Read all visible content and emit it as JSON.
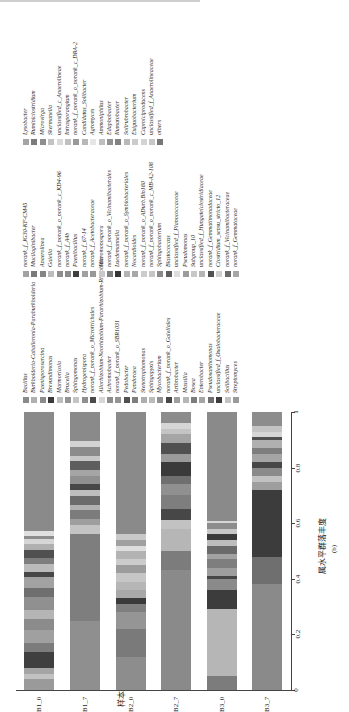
{
  "chart_data": {
    "type": "bar",
    "stacked": true,
    "orientation": "rotated (bars vertical, text rotated -90deg)",
    "xlabel": "属水平群落丰度",
    "ylabel": "样本",
    "panel_label": "(b)",
    "axis_ticks": [
      "0",
      "0.2",
      "0.4",
      "0.6",
      "0.8",
      "1"
    ],
    "xlim": [
      0,
      1
    ],
    "categories": [
      "B1_0",
      "B1_7",
      "B2_0",
      "B2_7",
      "B3_0",
      "B3_7"
    ],
    "legend": [
      {
        "name": "Bacillus",
        "color": "#8a8a8a"
      },
      {
        "name": "Burkholderia-Caballeronia-Paraburkholderia",
        "color": "#b0b0b0"
      },
      {
        "name": "Paenisporosarcina",
        "color": "#8c8c8c"
      },
      {
        "name": "Brevundimonas",
        "color": "#3a3a3a"
      },
      {
        "name": "Marmoricola",
        "color": "#bdbdbd"
      },
      {
        "name": "Brucella",
        "color": "#959595"
      },
      {
        "name": "Sphingomonas",
        "color": "#c4c4c4"
      },
      {
        "name": "Hydrogenispora",
        "color": "#8f8f8f"
      },
      {
        "name": "norank_f_norank_o_Microtrichales",
        "color": "#4a4a4a"
      },
      {
        "name": "Allorhizobium-Neorhizobium-Pararhizobium-Rhizobium",
        "color": "#d6d6d6"
      },
      {
        "name": "Achromobacter",
        "color": "#8d8d8d"
      },
      {
        "name": "norank_f_norank_o_SBR1031",
        "color": "#939393"
      },
      {
        "name": "Pedobacter",
        "color": "#505050"
      },
      {
        "name": "Pandoraea",
        "color": "#7e7e7e"
      },
      {
        "name": "Stenotrophomonas",
        "color": "#adadad"
      },
      {
        "name": "Sphingopyxis",
        "color": "#bbbbbb"
      },
      {
        "name": "Mycobacterium",
        "color": "#909090"
      },
      {
        "name": "norank_f_norank_o_Gaiellales",
        "color": "#474747"
      },
      {
        "name": "Arthrobacter",
        "color": "#9e9e9e"
      },
      {
        "name": "Massilia",
        "color": "#b6b6b6"
      },
      {
        "name": "Bosea",
        "color": "#7c7c7c"
      },
      {
        "name": "Enterobacter",
        "color": "#a5a5a5"
      },
      {
        "name": "Pseudoxanthomonas",
        "color": "#6f6f6f"
      },
      {
        "name": "unclassified_f_Oxalobacteraceae",
        "color": "#3c3c3c"
      },
      {
        "name": "Solibacillus",
        "color": "#c2c2c2"
      },
      {
        "name": "Streptomyces",
        "color": "#9a9a9a"
      },
      {
        "name": "norank_f_JG30-KF-CM45",
        "color": "#a2a2a2"
      },
      {
        "name": "Mucilaginibacter",
        "color": "#7a7a7a"
      },
      {
        "name": "Anaerolinea",
        "color": "#858585"
      },
      {
        "name": "Gaiella",
        "color": "#bcbcbc"
      },
      {
        "name": "norank_f_norank_o_norank_c_KD4-96",
        "color": "#8e8e8e"
      },
      {
        "name": "norank_f_A4b",
        "color": "#8b8b8b"
      },
      {
        "name": "Paenibacillus",
        "color": "#3f3f3f"
      },
      {
        "name": "norank_f_67-14",
        "color": "#a0a0a0"
      },
      {
        "name": "norank_f_Acetobacteraceae",
        "color": "#989898"
      },
      {
        "name": "Micromonospora",
        "color": "#c9c9c9"
      },
      {
        "name": "norank_f_norank_o_Vicinamibacterales",
        "color": "#7f7f7f"
      },
      {
        "name": "Luedemannella",
        "color": "#353535"
      },
      {
        "name": "norank_f_norank_o_Symbiobacteriales",
        "color": "#b3b3b3"
      },
      {
        "name": "Nocardioides",
        "color": "#a8a8a8"
      },
      {
        "name": "norank_f_norank_o_ADurb.Bin180",
        "color": "#cccccc"
      },
      {
        "name": "norank_f_norank_o_norank_c_MB-A2-108",
        "color": "#c6c6c6"
      },
      {
        "name": "Sphingobacterium",
        "color": "#8a8a8a"
      },
      {
        "name": "Blastococcus",
        "color": "#5e5e5e"
      },
      {
        "name": "unclassified_f_Planococcaceae",
        "color": "#dedede"
      },
      {
        "name": "Pseudomonas",
        "color": "#9c9c9c"
      },
      {
        "name": "Subgroup_10",
        "color": "#c7c7c7"
      },
      {
        "name": "unclassified_f_Hungateiclostridiaceae",
        "color": "#b5b5b5"
      },
      {
        "name": "norank_f_Gemmatimonadaceae",
        "color": "#515151"
      },
      {
        "name": "Clostridium_sensu_stricto_12",
        "color": "#cfcfcf"
      },
      {
        "name": "norank_f_Vicinamibacteraceae",
        "color": "#6a6a6a"
      },
      {
        "name": "norank_f_Gemmataceae",
        "color": "#a6a6a6"
      },
      {
        "name": "Lysobacter",
        "color": "#a4a4a4"
      },
      {
        "name": "Ruminiclostridium",
        "color": "#7b7b7b"
      },
      {
        "name": "Microvirga",
        "color": "#8e8e8e"
      },
      {
        "name": "Skermanella",
        "color": "#c3c3c3"
      },
      {
        "name": "unclassified_c_Anaerolineae",
        "color": "#dadada"
      },
      {
        "name": "Intrasporangium",
        "color": "#c0c0c0"
      },
      {
        "name": "norank_f_norank_o_norank_c_DRA-2",
        "color": "#999999"
      },
      {
        "name": "Candidatus_Solibacter",
        "color": "#b8b8b8"
      },
      {
        "name": "Agromyces",
        "color": "#e6e6e6"
      },
      {
        "name": "Ammoniphilus",
        "color": "#bfbfbf"
      },
      {
        "name": "Edaphobacter",
        "color": "#929292"
      },
      {
        "name": "Ilumatobacter",
        "color": "#828282"
      },
      {
        "name": "Solirubrobacter",
        "color": "#b9b9b9"
      },
      {
        "name": "Exiguobacterium",
        "color": "#cbcbcb"
      },
      {
        "name": "Caproiciproducens",
        "color": "#d3d3d3"
      },
      {
        "name": "unclassified_f_Anaerolineaceae",
        "color": "#c8c8c8"
      },
      {
        "name": "others",
        "color": "#777777"
      }
    ],
    "series_by_sample": {
      "B1_0": [
        [
          0.04,
          "#9a9a9a"
        ],
        [
          0.02,
          "#c2c2c2"
        ],
        [
          0.02,
          "#a5a5a5"
        ],
        [
          0.06,
          "#3f3f3f"
        ],
        [
          0.03,
          "#7c7c7c"
        ],
        [
          0.05,
          "#a0a0a0"
        ],
        [
          0.04,
          "#8b8b8b"
        ],
        [
          0.03,
          "#b5b5b5"
        ],
        [
          0.05,
          "#909090"
        ],
        [
          0.03,
          "#6f6f6f"
        ],
        [
          0.04,
          "#a2a2a2"
        ],
        [
          0.02,
          "#474747"
        ],
        [
          0.03,
          "#bbbbbb"
        ],
        [
          0.02,
          "#7e7e7e"
        ],
        [
          0.03,
          "#505050"
        ],
        [
          0.02,
          "#b0b0b0"
        ],
        [
          0.02,
          "#d6d6d6"
        ],
        [
          0.01,
          "#8d8d8d"
        ],
        [
          0.02,
          "#e0e0e0"
        ],
        [
          0.43,
          "#8a8a8a"
        ]
      ],
      "B1_7": [
        [
          0.24,
          "#8f8f8f"
        ],
        [
          0.3,
          "#7e7e7e"
        ],
        [
          0.03,
          "#c4c4c4"
        ],
        [
          0.02,
          "#9e9e9e"
        ],
        [
          0.03,
          "#7c7c7c"
        ],
        [
          0.02,
          "#b0b0b0"
        ],
        [
          0.03,
          "#6a6a6a"
        ],
        [
          0.02,
          "#bdbdbd"
        ],
        [
          0.02,
          "#474747"
        ],
        [
          0.03,
          "#909090"
        ],
        [
          0.02,
          "#a5a5a5"
        ],
        [
          0.03,
          "#5e5e5e"
        ],
        [
          0.02,
          "#c7c7c7"
        ],
        [
          0.03,
          "#8b8b8b"
        ],
        [
          0.02,
          "#d3d3d3"
        ],
        [
          0.1,
          "#8a8a8a"
        ]
      ],
      "B2_0": [
        [
          0.12,
          "#8d8d8d"
        ],
        [
          0.1,
          "#7a7a7a"
        ],
        [
          0.06,
          "#959595"
        ],
        [
          0.03,
          "#7f7f7f"
        ],
        [
          0.02,
          "#3a3a3a"
        ],
        [
          0.03,
          "#a8a8a8"
        ],
        [
          0.03,
          "#b6b6b6"
        ],
        [
          0.03,
          "#c6c6c6"
        ],
        [
          0.03,
          "#9c9c9c"
        ],
        [
          0.02,
          "#cccccc"
        ],
        [
          0.03,
          "#b3b3b3"
        ],
        [
          0.02,
          "#dedede"
        ],
        [
          0.02,
          "#a0a0a0"
        ],
        [
          0.02,
          "#c9c9c9"
        ],
        [
          0.44,
          "#8a8a8a"
        ]
      ],
      "B2_7": [
        [
          0.43,
          "#8a8a8a"
        ],
        [
          0.07,
          "#7c7c7c"
        ],
        [
          0.08,
          "#b6b6b6"
        ],
        [
          0.03,
          "#c2c2c2"
        ],
        [
          0.04,
          "#474747"
        ],
        [
          0.05,
          "#7e7e7e"
        ],
        [
          0.04,
          "#909090"
        ],
        [
          0.03,
          "#6f6f6f"
        ],
        [
          0.05,
          "#3a3a3a"
        ],
        [
          0.03,
          "#9a9a9a"
        ],
        [
          0.04,
          "#505050"
        ],
        [
          0.03,
          "#a5a5a5"
        ],
        [
          0.02,
          "#c4c4c4"
        ],
        [
          0.02,
          "#d6d6d6"
        ],
        [
          0.04,
          "#8c8c8c"
        ]
      ],
      "B3_0": [
        [
          0.05,
          "#7c7c7c"
        ],
        [
          0.24,
          "#b6b6b6"
        ],
        [
          0.07,
          "#3c3c3c"
        ],
        [
          0.04,
          "#8a8a8a"
        ],
        [
          0.01,
          "#474747"
        ],
        [
          0.03,
          "#9e9e9e"
        ],
        [
          0.03,
          "#7e7e7e"
        ],
        [
          0.02,
          "#a2a2a2"
        ],
        [
          0.03,
          "#6a6a6a"
        ],
        [
          0.02,
          "#bdbdbd"
        ],
        [
          0.02,
          "#3a3a3a"
        ],
        [
          0.02,
          "#c7c7c7"
        ],
        [
          0.02,
          "#8d8d8d"
        ],
        [
          0.01,
          "#d6d6d6"
        ],
        [
          0.39,
          "#8a8a8a"
        ]
      ],
      "B3_7": [
        [
          0.38,
          "#8a8a8a"
        ],
        [
          0.1,
          "#6f6f6f"
        ],
        [
          0.24,
          "#3c3c3c"
        ],
        [
          0.03,
          "#9e9e9e"
        ],
        [
          0.02,
          "#c2c2c2"
        ],
        [
          0.03,
          "#8b8b8b"
        ],
        [
          0.02,
          "#474747"
        ],
        [
          0.03,
          "#a5a5a5"
        ],
        [
          0.02,
          "#7e7e7e"
        ],
        [
          0.03,
          "#b0b0b0"
        ],
        [
          0.01,
          "#505050"
        ],
        [
          0.02,
          "#d6d6d6"
        ],
        [
          0.02,
          "#c4c4c4"
        ],
        [
          0.05,
          "#8d8d8d"
        ]
      ]
    }
  }
}
